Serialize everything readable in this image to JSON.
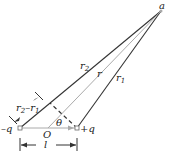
{
  "labels": {
    "point_a": "a",
    "r2": "r",
    "r2_sub": "2",
    "r": "r",
    "r1": "r",
    "r1_sub": "1",
    "diff_main": "r",
    "diff_sub2": "2",
    "diff_minus": "–r",
    "diff_sub1": "1",
    "neg_charge": "–q",
    "pos_charge": "+q",
    "origin": "O",
    "theta": "θ",
    "separation": "l"
  },
  "colors": {
    "line": "#333333",
    "gray_line": "#aaaaaa"
  }
}
